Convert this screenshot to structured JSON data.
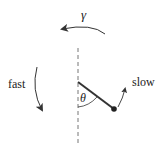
{
  "diagram": {
    "labels": {
      "gamma": "γ",
      "theta": "θ",
      "fast": "fast",
      "slow": "slow"
    },
    "colors": {
      "stroke": "#333333",
      "dashed": "#777777"
    }
  }
}
